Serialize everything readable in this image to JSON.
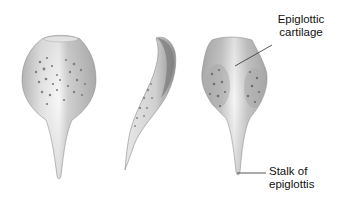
{
  "figure": {
    "views": [
      {
        "name": "anterior-view",
        "description": "Front view of epiglottis"
      },
      {
        "name": "lateral-view",
        "description": "Side view of epiglottis"
      },
      {
        "name": "posterior-view",
        "description": "Back view of epiglottis"
      }
    ],
    "labels": {
      "epiglottic_cartilage_line1": "Epiglottic",
      "epiglottic_cartilage_line2": "cartilage",
      "stalk_line1": "Stalk of",
      "stalk_line2": "epiglottis"
    },
    "colors": {
      "background": "#ffffff",
      "cartilage_light": "#f2f2f2",
      "cartilage_mid": "#cfcfcf",
      "cartilage_dark": "#8a8a8a",
      "pits": "#7a7a7a",
      "leader_line": "#444444",
      "text": "#111111"
    }
  }
}
